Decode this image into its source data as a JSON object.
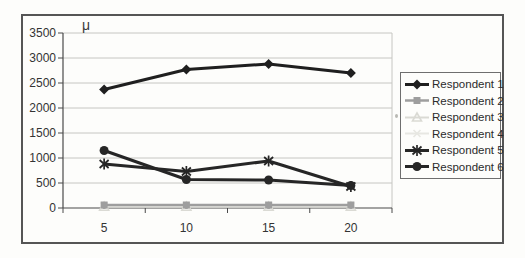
{
  "figure": {
    "background": "#fdfdfb",
    "frame_border_color": "#555555",
    "gridline_color": "#c6c6c2",
    "axis_color": "#4a4a4a",
    "tick_label_color": "#333333"
  },
  "chart_data": {
    "type": "line",
    "title": "",
    "xlabel": "",
    "ylabel": "μ",
    "x": [
      5,
      10,
      15,
      20
    ],
    "ylim": [
      0,
      3500
    ],
    "yticks": [
      0,
      500,
      1000,
      1500,
      2000,
      2500,
      3000,
      3500
    ],
    "grid": true,
    "legend_position": "right",
    "series": [
      {
        "name": "Respondent 1",
        "marker": "diamond",
        "color": "#1f1f1f",
        "line_width": 3,
        "values": [
          2370,
          2770,
          2880,
          2700
        ]
      },
      {
        "name": "Respondent 2",
        "marker": "square",
        "color": "#9e9e9e",
        "line_width": 2.5,
        "values": [
          60,
          60,
          60,
          60
        ]
      },
      {
        "name": "Respondent 3",
        "marker": "triangle",
        "color": "#dadad4",
        "line_width": 2,
        "values": [
          25,
          25,
          25,
          25
        ]
      },
      {
        "name": "Respondent 4",
        "marker": "x",
        "color": "#e7e7e2",
        "line_width": 2,
        "values": [
          40,
          40,
          40,
          40
        ]
      },
      {
        "name": "Respondent 5",
        "marker": "star",
        "color": "#262626",
        "line_width": 3,
        "values": [
          880,
          730,
          940,
          430
        ]
      },
      {
        "name": "Respondent 6",
        "marker": "circle",
        "color": "#262626",
        "line_width": 3,
        "values": [
          1150,
          570,
          560,
          450
        ]
      }
    ]
  }
}
